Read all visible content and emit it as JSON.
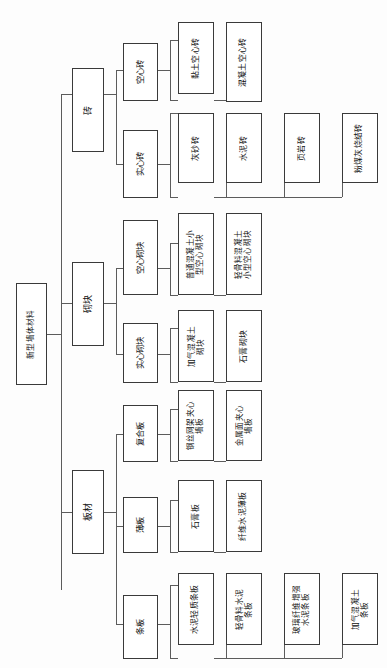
{
  "diagram": {
    "title": "新型墙体材料",
    "orientation": "rotated-90",
    "root": {
      "label": "新型墙体材料"
    },
    "level2": [
      {
        "label": "砖"
      },
      {
        "label": "砌块"
      },
      {
        "label": "板材"
      }
    ],
    "level3": [
      {
        "label": "空心砖"
      },
      {
        "label": "实心砖"
      },
      {
        "label": "空心砌块"
      },
      {
        "label": "实心砌块"
      },
      {
        "label": "复合板"
      },
      {
        "label": "薄板"
      },
      {
        "label": "条板"
      }
    ],
    "leaves": {
      "hollow_brick": [
        {
          "label": "黏土空心砖"
        },
        {
          "label": "混凝土空心砖"
        }
      ],
      "solid_brick": [
        {
          "label": "灰砂砖"
        },
        {
          "label": "水泥砖"
        },
        {
          "label": "页岩砖"
        },
        {
          "label": "粉煤灰烧结砖"
        }
      ],
      "hollow_block": [
        {
          "label": "普通混凝土小\n型空心砌块"
        },
        {
          "label": "轻骨料混凝土\n小型空心砌块"
        }
      ],
      "solid_block": [
        {
          "label": "加气混凝土\n砌块"
        },
        {
          "label": "石膏砌块"
        }
      ],
      "composite_panel": [
        {
          "label": "钢丝网架夹心\n墙板"
        },
        {
          "label": "金属面夹心\n墙板"
        }
      ],
      "thin_panel": [
        {
          "label": "石膏板"
        },
        {
          "label": "纤维水泥薄板"
        }
      ],
      "strip_panel": [
        {
          "label": "水泥轻质条板"
        },
        {
          "label": "轻骨料水泥\n条板"
        },
        {
          "label": "玻璃纤维增强\n水泥条板"
        },
        {
          "label": "加气混凝土\n条板"
        }
      ]
    }
  }
}
